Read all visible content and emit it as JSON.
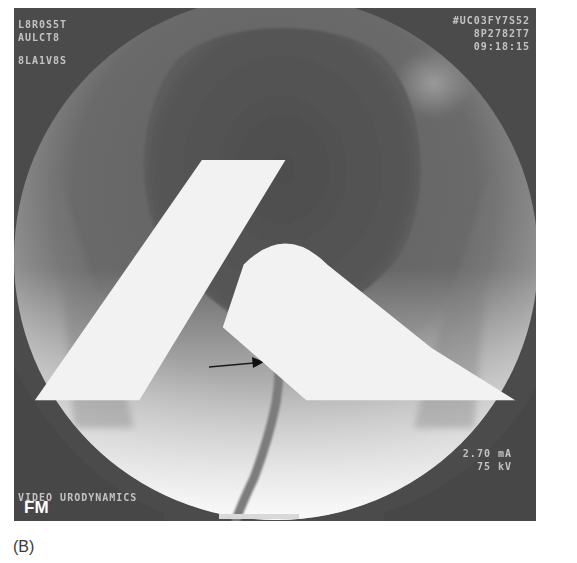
{
  "figure": {
    "caption": "(B)",
    "image_type": "fluoroscopic voiding cystourethrogram",
    "overlay": {
      "top_left": [
        "L8R0S5T",
        "AULCT8",
        "8LA1V8S"
      ],
      "top_right": [
        "#UC03FY7S52",
        "8P2782T7",
        "09:18:15"
      ],
      "bottom_right": [
        "2.70 mA",
        "75 kV"
      ],
      "bottom_left": "VIDEO URODYNAMICS",
      "corner_label": "FM"
    },
    "annotations": {
      "arrows": [
        {
          "direction": "right",
          "description": "arrow pointing to bladder neck from left"
        },
        {
          "direction": "left",
          "description": "arrow pointing to bladder neck from right"
        }
      ]
    },
    "colors": {
      "background": "#4a4a4a",
      "bladder": "#555555",
      "bright_field": "#e8e8e8",
      "text": "#d8d8d8"
    }
  }
}
